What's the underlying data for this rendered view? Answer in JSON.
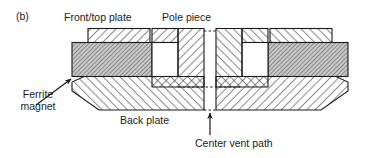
{
  "figure": {
    "panel_letter": "(b)",
    "type": "cross-section-diagram",
    "labels": {
      "front_top_plate": "Front/top plate",
      "pole_piece": "Pole piece",
      "ferrite_magnet": "Ferrite\nmagnet",
      "ferrite_magnet_line1": "Ferrite",
      "ferrite_magnet_line2": "magnet",
      "back_plate": "Back plate",
      "center_vent_path": "Center vent path"
    },
    "colors": {
      "outline": "#1a1a1a",
      "hatch": "#2b2b2b",
      "magnet_fill": "#b9b9b9",
      "gap_fill": "#ffffff",
      "background": "#ffffff",
      "dotted": "#1a1a1a"
    },
    "parts": [
      {
        "name": "front-top-plate",
        "hatch": "diagonal-45",
        "fill": "white"
      },
      {
        "name": "pole-piece",
        "hatch": "diagonal-45",
        "fill": "white"
      },
      {
        "name": "ferrite-magnet",
        "hatch": "cross-fine",
        "fill": "gray"
      },
      {
        "name": "back-plate",
        "hatch": "diagonal-45",
        "fill": "white"
      },
      {
        "name": "air-gap",
        "hatch": "none",
        "fill": "white"
      },
      {
        "name": "center-vent-path",
        "hatch": "none",
        "fill": "white"
      }
    ],
    "annotations": {
      "ferrite_leader": "arrow from Ferrite magnet text to left face of magnet",
      "vent_arrow": "upward arrow pointing into center vent path",
      "centerline_count": 3,
      "centerline_style": "dotted"
    }
  }
}
